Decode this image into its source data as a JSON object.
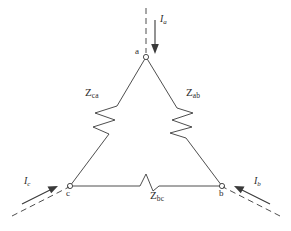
{
  "figure": {
    "kind": "circuit-diagram",
    "background_color": "#ffffff",
    "line_color": "#3a3a3a",
    "text_color": "#2b2b2b"
  },
  "nodes": [
    {
      "id": "a",
      "label": "a",
      "x": 146,
      "y": 57,
      "label_x": 135,
      "label_y": 49
    },
    {
      "id": "b",
      "label": "b",
      "x": 222,
      "y": 186,
      "label_x": 219,
      "label_y": 190
    },
    {
      "id": "c",
      "label": "c",
      "x": 70,
      "y": 186,
      "label_x": 67,
      "label_y": 190
    }
  ],
  "impedances": [
    {
      "id": "z_ca",
      "symbol": "Z",
      "subscript": "ca",
      "side": "left",
      "label_x": 87,
      "label_y": 93
    },
    {
      "id": "z_ab",
      "symbol": "Z",
      "subscript": "ab",
      "side": "right",
      "label_x": 188,
      "label_y": 93
    },
    {
      "id": "z_bc",
      "symbol": "Z",
      "subscript": "bc",
      "side": "bottom",
      "label_x": 152,
      "label_y": 194
    }
  ],
  "currents": [
    {
      "id": "i_a",
      "symbol": "I",
      "subscript": "a",
      "direction": "down",
      "into_node": "a",
      "label_x": 157,
      "label_y": 17
    },
    {
      "id": "i_b",
      "symbol": "I",
      "subscript": "b",
      "direction": "up-left",
      "into_node": "b",
      "label_x": 254,
      "label_y": 181
    },
    {
      "id": "i_c",
      "symbol": "I",
      "subscript": "c",
      "direction": "up-right",
      "into_node": "c",
      "label_x": 26,
      "label_y": 181
    }
  ]
}
